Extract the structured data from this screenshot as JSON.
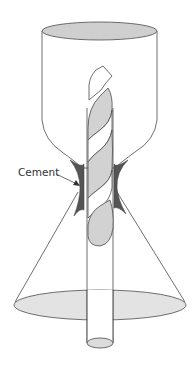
{
  "diagram": {
    "type": "illustration",
    "labels": {
      "cement": "Cement"
    },
    "colors": {
      "stroke": "#4a4a4a",
      "top_ellipse_fill": "#cfcfcf",
      "bottom_ellipse_fill": "#e3e3e3",
      "twist_fill": "#d2d2d2",
      "cement_fill": "#555555",
      "rod_end_fill": "#dcdcdc",
      "background": "#ffffff"
    },
    "parts": [
      {
        "name": "upper-vessel",
        "shape": "cylinder tapering to neck"
      },
      {
        "name": "twisted-rod",
        "shape": "helical twisted strip"
      },
      {
        "name": "cement-joint",
        "shape": "dark fill at neck"
      },
      {
        "name": "lower-cone",
        "shape": "cone with elliptical base"
      },
      {
        "name": "rod",
        "shape": "straight cylinder extending below cone"
      }
    ]
  }
}
